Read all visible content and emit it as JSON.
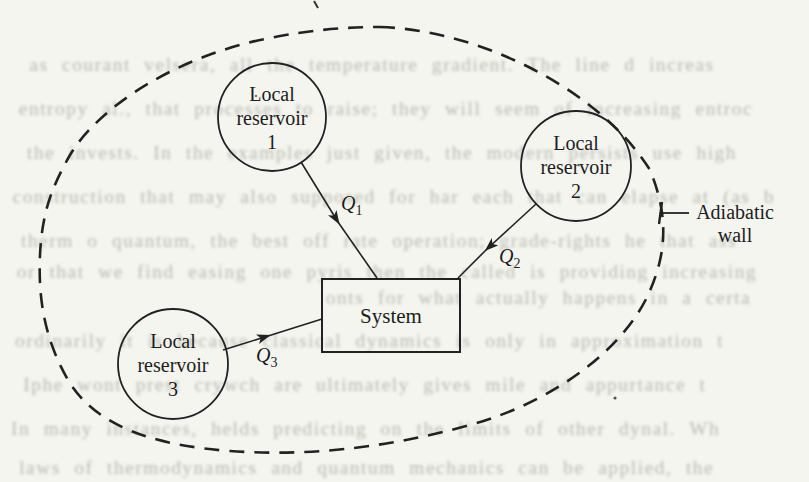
{
  "figure": {
    "nodes": {
      "reservoir1": {
        "lines": [
          "Local",
          "reservoir",
          "1"
        ]
      },
      "reservoir2": {
        "lines": [
          "Local",
          "reservoir",
          "2"
        ]
      },
      "reservoir3": {
        "lines": [
          "Local",
          "reservoir",
          "3"
        ]
      },
      "system": {
        "label": "System"
      }
    },
    "flows": [
      {
        "symbol": "Q",
        "sub": "1"
      },
      {
        "symbol": "Q",
        "sub": "2"
      },
      {
        "symbol": "Q",
        "sub": "3"
      }
    ],
    "boundary": {
      "label_line1": "Adiabatic",
      "label_line2": "wall"
    },
    "colors": {
      "ink": "#222222",
      "paper": "#f5f5f0",
      "bleed": "#aaaaa2"
    }
  },
  "background": {
    "noise_lines": [
      {
        "y": 54,
        "x": 36,
        "text": "as courant velsera, all the temperature gradient. The line d increas"
      },
      {
        "y": 98,
        "x": 26,
        "text": "entropy al., that processes to raise; they will seem of increasing entroc"
      },
      {
        "y": 142,
        "x": 34,
        "text": "the invests. In the examples just given, the modern persists use high"
      },
      {
        "y": 186,
        "x": 20,
        "text": "construction that may also supposed for har each that can elapse at (as b"
      },
      {
        "y": 230,
        "x": 28,
        "text": "therm o quantum, the best off rate operation; grade-rights he that ass"
      },
      {
        "y": 261,
        "x": 24,
        "text": "or that we find easing one pyris then the called is providing increasing"
      },
      {
        "y": 287,
        "x": 330,
        "text": "onts for what actually happens in a certa"
      },
      {
        "y": 330,
        "x": 22,
        "text": "ordinarily it is because classical dynamics is only in approximation t"
      },
      {
        "y": 374,
        "x": 30,
        "text": "Iphe wont prest crywch are ultimately gives mile and appurtance t"
      },
      {
        "y": 418,
        "x": 18,
        "text": "In many instances, helds predicting on the limits of other dynal. Wh"
      },
      {
        "y": 457,
        "x": 26,
        "text": "laws of thermodynamics and quantum mechanics can be applied, the"
      }
    ]
  }
}
